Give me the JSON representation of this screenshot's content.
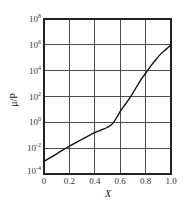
{
  "chart_data": {
    "type": "line",
    "title": "",
    "xlabel": "X",
    "ylabel": "μ/P",
    "xscale": "linear",
    "yscale": "log",
    "xlim": [
      0,
      1.0
    ],
    "ylim": [
      0.0001,
      100000000
    ],
    "ylim_log10": [
      -4,
      8
    ],
    "grid": true,
    "legend": null,
    "x_ticks": [
      {
        "value": 0,
        "label": "0"
      },
      {
        "value": 0.2,
        "label": "0.2"
      },
      {
        "value": 0.4,
        "label": "0.4"
      },
      {
        "value": 0.6,
        "label": "0.6"
      },
      {
        "value": 0.8,
        "label": "0.8"
      },
      {
        "value": 1.0,
        "label": "1.0"
      }
    ],
    "y_ticks": [
      {
        "exponent": 8,
        "base": "10",
        "sup": "8"
      },
      {
        "exponent": 6,
        "base": "10",
        "sup": "6"
      },
      {
        "exponent": 4,
        "base": "10",
        "sup": "4"
      },
      {
        "exponent": 2,
        "base": "10",
        "sup": "2"
      },
      {
        "exponent": 0,
        "base": "10",
        "sup": "0"
      },
      {
        "exponent": -2,
        "base": "10",
        "sup": "-2"
      },
      {
        "exponent": -4,
        "base": "10",
        "sup": "-4"
      }
    ],
    "series": [
      {
        "name": "μ/P",
        "x": [
          0.0,
          0.1,
          0.2,
          0.3,
          0.4,
          0.45,
          0.5,
          0.54,
          0.58,
          0.6,
          0.64,
          0.68,
          0.72,
          0.76,
          0.8,
          0.84,
          0.88,
          0.92,
          0.96,
          1.0
        ],
        "y_log10": [
          -3.02,
          -2.44,
          -1.84,
          -1.31,
          -0.8,
          -0.6,
          -0.38,
          -0.1,
          0.5,
          0.85,
          1.4,
          1.95,
          2.6,
          3.25,
          3.8,
          4.35,
          4.85,
          5.3,
          5.65,
          5.98
        ]
      }
    ]
  }
}
